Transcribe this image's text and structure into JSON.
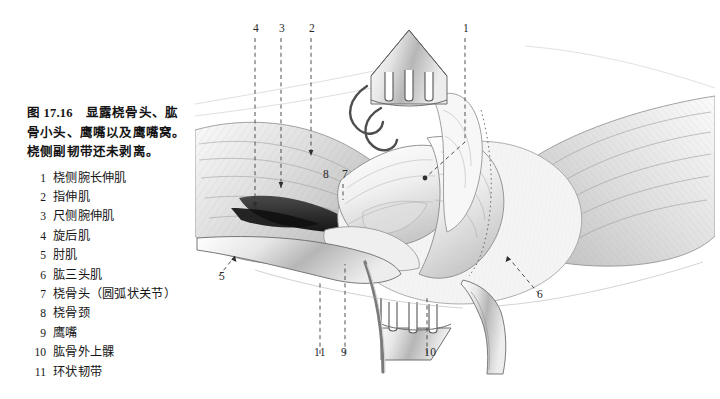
{
  "figure": {
    "number": "图 17.16",
    "caption_lines": [
      "图 17.16　显露桡骨头、肱",
      "骨小头、鹰嘴以及鹰嘴窝。",
      "桡侧副韧带还未剥离。"
    ],
    "legend": [
      {
        "num": "1",
        "label": "桡侧腕长伸肌"
      },
      {
        "num": "2",
        "label": "指伸肌"
      },
      {
        "num": "3",
        "label": "尺侧腕伸肌"
      },
      {
        "num": "4",
        "label": "旋后肌"
      },
      {
        "num": "5",
        "label": "肘肌"
      },
      {
        "num": "6",
        "label": "肱三头肌"
      },
      {
        "num": "7",
        "label": "桡骨头（圆弧状关节）"
      },
      {
        "num": "8",
        "label": "桡骨颈"
      },
      {
        "num": "9",
        "label": "鹰嘴"
      },
      {
        "num": "10",
        "label": "肱骨外上髁"
      },
      {
        "num": "11",
        "label": "环状韧带"
      }
    ],
    "callouts": [
      {
        "id": "4",
        "text": "4",
        "x": 253,
        "y": 28
      },
      {
        "id": "3",
        "text": "3",
        "x": 279,
        "y": 28
      },
      {
        "id": "2",
        "text": "2",
        "x": 309,
        "y": 28
      },
      {
        "id": "1",
        "text": "1",
        "x": 463,
        "y": 28
      },
      {
        "id": "8",
        "text": "8",
        "x": 323,
        "y": 170
      },
      {
        "id": "7",
        "text": "7",
        "x": 342,
        "y": 170
      },
      {
        "id": "5",
        "text": "5",
        "x": 219,
        "y": 272
      },
      {
        "id": "6",
        "text": "6",
        "x": 537,
        "y": 290
      },
      {
        "id": "11",
        "text": "11",
        "x": 316,
        "y": 349
      },
      {
        "id": "9",
        "text": "9",
        "x": 341,
        "y": 349
      },
      {
        "id": "10",
        "text": "10",
        "x": 425,
        "y": 349
      }
    ],
    "artwork": {
      "style": "pencil-hatch-medical-illustration",
      "subject": "elbow surgical exposure of radial head, capitellum, olecranon and olecranon fossa",
      "palette": {
        "background": "#ffffff",
        "ink": "#1a1a1a",
        "tissue_light": "#f2f2f2",
        "tissue_mid": "#d8d8d8",
        "tissue_dark": "#a9a9a9",
        "shadow_deep": "#2b2b2b",
        "leader": "#3a3a3a"
      }
    }
  }
}
